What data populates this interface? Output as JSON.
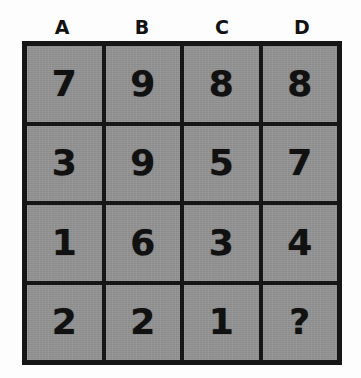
{
  "puzzle": {
    "title": "Number Grid Puzzle",
    "columns": [
      "A",
      "B",
      "C",
      "D"
    ],
    "unknown_marker": "?",
    "cell_color": "#939393",
    "border_color": "#161616",
    "text_color": "#111111",
    "background_color": "#fdfdfd",
    "rows": [
      {
        "cells": [
          "7",
          "9",
          "8",
          "8"
        ]
      },
      {
        "cells": [
          "3",
          "9",
          "5",
          "7"
        ]
      },
      {
        "cells": [
          "1",
          "6",
          "3",
          "4"
        ]
      },
      {
        "cells": [
          "2",
          "2",
          "1",
          "?"
        ]
      }
    ]
  },
  "chart_data": {
    "type": "table",
    "columns": [
      "A",
      "B",
      "C",
      "D"
    ],
    "rows": [
      [
        "7",
        "9",
        "8",
        "8"
      ],
      [
        "3",
        "9",
        "5",
        "7"
      ],
      [
        "1",
        "6",
        "3",
        "4"
      ],
      [
        "2",
        "2",
        "1",
        "?"
      ]
    ],
    "annotations": [
      "The bottom-right cell (column D, row 4) contains a question mark indicating the missing value."
    ],
    "grid": true,
    "legend": "none"
  }
}
